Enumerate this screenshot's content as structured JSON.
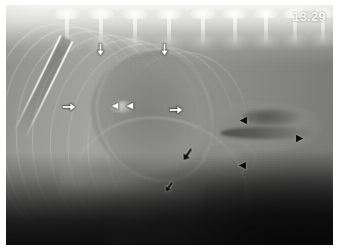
{
  "figure": {
    "kind": "lateral-thoracic-radiograph",
    "modality_label": "radiograph",
    "timestamp": "13.29",
    "plate_background": "#6e6e6e",
    "margin_color": "#ffffff",
    "timestamp_color": "#ffffff"
  },
  "anatomy": {
    "regions": [
      {
        "name": "vertebral-column",
        "label": "Thoracic vertebrae"
      },
      {
        "name": "cardiac-silhouette",
        "label": "Cardiac silhouette"
      },
      {
        "name": "trachea",
        "label": "Trachea"
      },
      {
        "name": "carina",
        "label": "Carina"
      },
      {
        "name": "diaphragm",
        "label": "Diaphragm"
      },
      {
        "name": "liver-mass",
        "label": "Cranial abdomen"
      },
      {
        "name": "sternum",
        "label": "Sternum"
      }
    ],
    "vertebrae": [
      {
        "x": 44,
        "scale": 1.0
      },
      {
        "x": 78,
        "scale": 1.0
      },
      {
        "x": 112,
        "scale": 1.0
      },
      {
        "x": 146,
        "scale": 1.0
      },
      {
        "x": 180,
        "scale": 0.98
      },
      {
        "x": 212,
        "scale": 0.96
      },
      {
        "x": 243,
        "scale": 0.94
      },
      {
        "x": 272,
        "scale": 0.92
      },
      {
        "x": 300,
        "scale": 0.9
      }
    ],
    "rib_arcs": [
      {
        "left": -16,
        "top": 18,
        "width": 150,
        "height": 215,
        "rotate": -6,
        "thickness": 1.5,
        "opacity": 0.4
      },
      {
        "left": -4,
        "top": 22,
        "width": 152,
        "height": 218,
        "rotate": -4,
        "thickness": 1.4,
        "opacity": 0.36
      },
      {
        "left": 10,
        "top": 26,
        "width": 154,
        "height": 214,
        "rotate": -2,
        "thickness": 1.4,
        "opacity": 0.34
      },
      {
        "left": 26,
        "top": 30,
        "width": 152,
        "height": 208,
        "rotate": 1,
        "thickness": 1.3,
        "opacity": 0.32
      },
      {
        "left": 44,
        "top": 34,
        "width": 150,
        "height": 200,
        "rotate": 4,
        "thickness": 1.3,
        "opacity": 0.3
      },
      {
        "left": 62,
        "top": 38,
        "width": 148,
        "height": 192,
        "rotate": 7,
        "thickness": 1.2,
        "opacity": 0.28
      },
      {
        "left": 82,
        "top": 42,
        "width": 144,
        "height": 182,
        "rotate": 10,
        "thickness": 1.2,
        "opacity": 0.26
      },
      {
        "left": 102,
        "top": 46,
        "width": 138,
        "height": 172,
        "rotate": 13,
        "thickness": 1.1,
        "opacity": 0.24
      }
    ]
  },
  "annotations": {
    "description": "Arrow and arrowhead markers overlaid on the radiograph",
    "markers": [
      {
        "id": "white-arrow-dorsal-left",
        "name": "white-arrow-down-dorsal-left",
        "style": "white",
        "shape": "arrow",
        "direction": "down",
        "x": 88,
        "y": 38,
        "size": 13
      },
      {
        "id": "white-arrow-dorsal-right",
        "name": "white-arrow-down-dorsal-right",
        "style": "white",
        "shape": "arrow",
        "direction": "down",
        "x": 152,
        "y": 38,
        "size": 13
      },
      {
        "id": "white-arrow-mid-left",
        "name": "white-arrow-right-mid-left",
        "style": "white",
        "shape": "arrow",
        "direction": "right",
        "x": 56,
        "y": 95,
        "size": 14
      },
      {
        "id": "white-arrowhead-left",
        "name": "white-arrowhead-left-inner",
        "style": "white",
        "shape": "arrowhead",
        "direction": "left",
        "x": 104,
        "y": 96,
        "size": 10
      },
      {
        "id": "white-arrowhead-right",
        "name": "white-arrowhead-right-inner",
        "style": "white",
        "shape": "arrowhead",
        "direction": "left",
        "x": 119,
        "y": 96,
        "size": 10
      },
      {
        "id": "white-arrow-mid-right",
        "name": "white-arrow-right-mid-right",
        "style": "white",
        "shape": "arrow",
        "direction": "right",
        "x": 163,
        "y": 98,
        "size": 14
      },
      {
        "id": "black-arrowhead-upper",
        "name": "black-arrowhead-left-upper",
        "style": "black",
        "shape": "arrowhead",
        "direction": "left",
        "x": 232,
        "y": 110,
        "size": 11
      },
      {
        "id": "black-arrowhead-far-right",
        "name": "black-arrowhead-right-far",
        "style": "black",
        "shape": "arrowhead",
        "direction": "right",
        "x": 288,
        "y": 128,
        "size": 11
      },
      {
        "id": "black-arrowhead-lower",
        "name": "black-arrowhead-left-lower",
        "style": "black",
        "shape": "arrowhead",
        "direction": "left",
        "x": 231,
        "y": 155,
        "size": 11
      },
      {
        "id": "black-arrow-mid",
        "name": "black-arrow-down-left-mid",
        "style": "black",
        "shape": "arrow",
        "direction": "down-left",
        "x": 174,
        "y": 142,
        "size": 15
      },
      {
        "id": "black-arrow-lower",
        "name": "black-arrow-down-left-lower",
        "style": "black",
        "shape": "arrow",
        "direction": "down-left",
        "x": 157,
        "y": 176,
        "size": 12
      }
    ]
  }
}
